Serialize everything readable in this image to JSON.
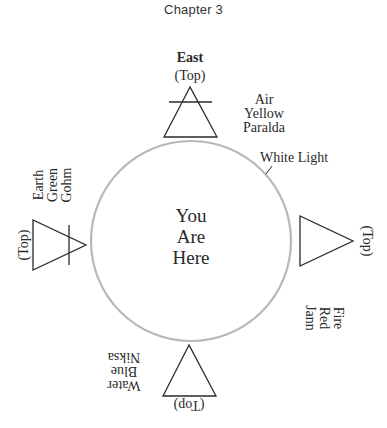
{
  "header": {
    "chapter": "Chapter 3"
  },
  "diagram": {
    "center_circle": {
      "label_lines": [
        "You",
        "Are",
        "Here"
      ],
      "outline_label": "White Light",
      "stroke_color": "#b8b8b8"
    },
    "east": {
      "direction": "East",
      "top_marker": "(Top)",
      "element": "Air",
      "color": "Yellow",
      "elemental": "Paralda",
      "symbol": "air-triangle-icon"
    },
    "south": {
      "top_marker": "(Top)",
      "element": "Fire",
      "color": "Red",
      "elemental": "Jann",
      "symbol": "fire-triangle-icon"
    },
    "west": {
      "top_marker": "(Top)",
      "element": "Water",
      "color": "Blue",
      "elemental": "Niksa",
      "symbol": "water-triangle-icon"
    },
    "north": {
      "top_marker": "(Top)",
      "element": "Earth",
      "color": "Green",
      "elemental": "Gohm",
      "symbol": "earth-triangle-icon"
    },
    "line_color": "#2a2a2a"
  }
}
